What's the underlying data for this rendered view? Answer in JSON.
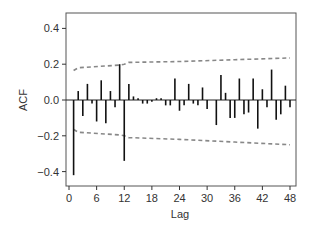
{
  "chart_data": {
    "type": "bar",
    "subtype": "acf-stem",
    "title": "",
    "xlabel": "Lag",
    "ylabel": "ACF",
    "xlim": [
      0,
      48
    ],
    "ylim": [
      -0.45,
      0.47
    ],
    "x_ticks": [
      0,
      6,
      12,
      18,
      24,
      30,
      36,
      42,
      48
    ],
    "y_ticks": [
      -0.4,
      -0.2,
      0.0,
      0.2,
      0.4
    ],
    "y_tick_labels": [
      "-0.4",
      "-0.2",
      "0.0",
      "0.2",
      "0.4"
    ],
    "grid": false,
    "legend": null,
    "x": [
      1,
      2,
      3,
      4,
      5,
      6,
      7,
      8,
      9,
      10,
      11,
      12,
      13,
      14,
      15,
      16,
      17,
      18,
      19,
      20,
      21,
      22,
      23,
      24,
      25,
      26,
      27,
      28,
      29,
      30,
      31,
      32,
      33,
      34,
      35,
      36,
      37,
      38,
      39,
      40,
      41,
      42,
      43,
      44,
      45,
      46,
      47,
      48
    ],
    "values": [
      -0.42,
      0.05,
      -0.09,
      0.09,
      -0.02,
      -0.12,
      0.11,
      -0.13,
      0.05,
      -0.04,
      0.2,
      -0.34,
      0.09,
      0.02,
      0.01,
      -0.02,
      -0.02,
      -0.01,
      0.01,
      0.01,
      -0.03,
      -0.03,
      0.12,
      -0.06,
      -0.03,
      0.09,
      -0.02,
      -0.03,
      0.07,
      -0.05,
      0.0,
      -0.14,
      0.14,
      0.04,
      -0.1,
      -0.1,
      0.12,
      -0.08,
      -0.07,
      0.12,
      -0.16,
      0.06,
      -0.04,
      0.17,
      -0.11,
      -0.08,
      0.08,
      -0.04
    ],
    "confidence_band": {
      "style": "dashed",
      "color": "#888888",
      "upper": [
        [
          1,
          0.165
        ],
        [
          2,
          0.18
        ],
        [
          11,
          0.195
        ],
        [
          12,
          0.2
        ],
        [
          13,
          0.21
        ],
        [
          24,
          0.215
        ],
        [
          36,
          0.225
        ],
        [
          48,
          0.235
        ]
      ],
      "lower": [
        [
          1,
          -0.165
        ],
        [
          2,
          -0.18
        ],
        [
          11,
          -0.195
        ],
        [
          12,
          -0.2
        ],
        [
          13,
          -0.21
        ],
        [
          24,
          -0.22
        ],
        [
          36,
          -0.235
        ],
        [
          48,
          -0.25
        ]
      ]
    },
    "colors": {
      "bars": "#111111",
      "axis": "#333333",
      "band": "#888888"
    }
  }
}
